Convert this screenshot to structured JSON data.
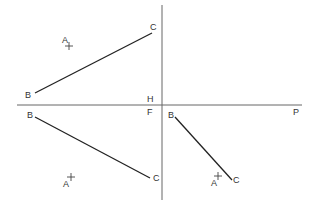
{
  "diagram": {
    "type": "orthographic-projection",
    "colors": {
      "background": "#ffffff",
      "axis": "#666666",
      "segment": "#222222",
      "label": "#333333"
    },
    "axes": {
      "horizontal": {
        "x1": 17,
        "y1": 105,
        "x2": 302,
        "y2": 105
      },
      "vertical": {
        "x1": 162,
        "y1": 5,
        "x2": 162,
        "y2": 200
      },
      "labels": [
        {
          "text": "H",
          "x": 147,
          "y": 102
        },
        {
          "text": "F",
          "x": 147,
          "y": 115
        },
        {
          "text": "P",
          "x": 293,
          "y": 115
        }
      ]
    },
    "views": [
      {
        "name": "top-view",
        "segment": {
          "x1": 35,
          "y1": 93,
          "x2": 152,
          "y2": 33
        },
        "point": {
          "x": 69,
          "y": 46
        },
        "labels": [
          {
            "text": "B",
            "x": 25,
            "y": 98
          },
          {
            "text": "C",
            "x": 150,
            "y": 30
          },
          {
            "text": "A",
            "x": 62,
            "y": 43
          }
        ]
      },
      {
        "name": "front-view",
        "segment": {
          "x1": 35,
          "y1": 117,
          "x2": 150,
          "y2": 178
        },
        "point": {
          "x": 71,
          "y": 177
        },
        "labels": [
          {
            "text": "B",
            "x": 27,
            "y": 118
          },
          {
            "text": "C",
            "x": 153,
            "y": 181
          },
          {
            "text": "A",
            "x": 63,
            "y": 187
          }
        ]
      },
      {
        "name": "profile-view",
        "segment": {
          "x1": 175,
          "y1": 117,
          "x2": 232,
          "y2": 180
        },
        "point": {
          "x": 218,
          "y": 176
        },
        "labels": [
          {
            "text": "B",
            "x": 168,
            "y": 118
          },
          {
            "text": "C",
            "x": 233,
            "y": 183
          },
          {
            "text": "A",
            "x": 211,
            "y": 186
          }
        ]
      }
    ]
  }
}
